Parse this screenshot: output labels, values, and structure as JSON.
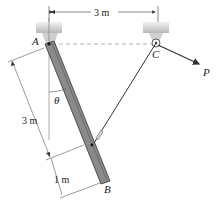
{
  "figure": {
    "labels": {
      "A": "A",
      "B": "B",
      "C": "C",
      "P": "P",
      "theta": "θ"
    },
    "dimensions": {
      "top_span": "3 m",
      "bar_upper": "3 m",
      "bar_lower": "1 m"
    },
    "colors": {
      "bar": "#8a8a8a",
      "bar_edge": "#333333",
      "support": "#c9c9c9",
      "cable": "#333333",
      "dashed": "#999999"
    }
  }
}
